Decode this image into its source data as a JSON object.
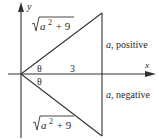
{
  "diagram": {
    "type": "reference-triangles",
    "axes": {
      "x_label": "x",
      "y_label": "y"
    },
    "upper_triangle": {
      "hypotenuse_label": "√(a² + 9)",
      "hyp_radical": "a",
      "hyp_exp": "2",
      "hyp_rest": " + 9",
      "adjacent_label": "3",
      "angle_label": "θ",
      "opposite_label": "a, positive",
      "opposite_var": "a",
      "opposite_text": ", positive"
    },
    "lower_triangle": {
      "hypotenuse_label": "√(a² + 9)",
      "hyp_radical": "a",
      "hyp_exp": "2",
      "hyp_rest": " + 9",
      "angle_label": "θ",
      "opposite_label": "a, negative",
      "opposite_var": "a",
      "opposite_text": ", negative"
    },
    "colors": {
      "line": "#333333",
      "text": "#2a2a2a",
      "background": "#ffffff"
    }
  }
}
